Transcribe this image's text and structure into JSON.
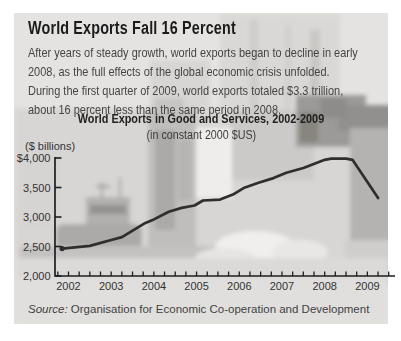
{
  "header": {
    "title": "World Exports Fall 16 Percent"
  },
  "intro": {
    "lines": [
      "After years of steady growth, world exports began to decline in early",
      "2008, as the full effects of the global economic crisis unfolded.",
      "During the first quarter of 2009, world exports totaled $3.3 trillion,",
      "about 16 percent less than the same period in 2008."
    ]
  },
  "source": {
    "prefix": "Source:",
    "text": " Organisation for Economic Co-operation and Development"
  },
  "colors": {
    "panel_bg": "#e4e3e1",
    "line": "#2e2e2e",
    "axis": "#1f1f1f",
    "title_text": "#1b1b1b",
    "body_text": "#454545"
  },
  "chart_data": {
    "type": "line",
    "title": "World Exports in Good and Services, 2002-2009",
    "subtitle": "(in constant 2000 $US)",
    "ylabel": "($ billions)",
    "xlabel": "",
    "ylim": [
      2000,
      4000
    ],
    "grid": false,
    "legend": "none",
    "line_color": "#2e2e2e",
    "axis_color": "#1f1f1f",
    "minor_x_ticks_per_year": 4,
    "y_ticks": [
      {
        "value": 4000,
        "label": "$4,000"
      },
      {
        "value": 3500,
        "label": "3,500"
      },
      {
        "value": 3000,
        "label": "3,000"
      },
      {
        "value": 2500,
        "label": "2,500"
      },
      {
        "value": 2000,
        "label": "2,000"
      }
    ],
    "x_labels": [
      "2002",
      "2003",
      "2004",
      "2005",
      "2006",
      "2007",
      "2008",
      "2009"
    ],
    "series": [
      {
        "name": "World exports, goods and services ($ billions, constant 2000 $US)",
        "points": [
          [
            2001.85,
            2465
          ],
          [
            2002.5,
            2510
          ],
          [
            2003.0,
            2610
          ],
          [
            2003.25,
            2660
          ],
          [
            2003.8,
            2900
          ],
          [
            2004.0,
            2960
          ],
          [
            2004.35,
            3090
          ],
          [
            2004.65,
            3155
          ],
          [
            2004.95,
            3195
          ],
          [
            2005.15,
            3280
          ],
          [
            2005.55,
            3295
          ],
          [
            2005.85,
            3380
          ],
          [
            2006.1,
            3490
          ],
          [
            2006.45,
            3580
          ],
          [
            2006.8,
            3660
          ],
          [
            2007.1,
            3750
          ],
          [
            2007.5,
            3830
          ],
          [
            2008.0,
            3970
          ],
          [
            2008.15,
            3990
          ],
          [
            2008.5,
            3990
          ],
          [
            2008.65,
            3970
          ],
          [
            2009.25,
            3320
          ]
        ]
      }
    ],
    "annotation": "Exports peak near $4,000B during 2008, then fall about 16% to ~$3,300B by Q1 2009"
  }
}
